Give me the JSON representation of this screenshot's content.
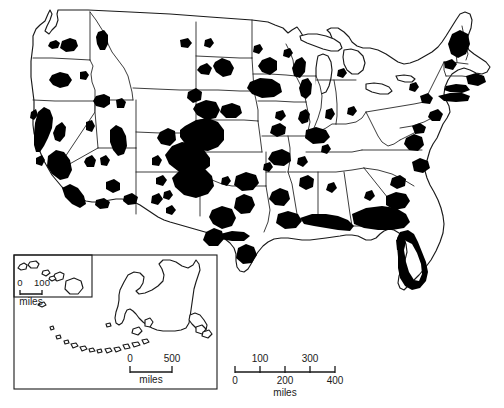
{
  "map": {
    "title": "United States distribution map",
    "description": "Black-and-white thematic map of the contiguous United States with state boundaries and solid black shaded distribution areas, plus Alaska and Hawaii insets.",
    "background_color": "#ffffff",
    "outline_color": "#1a1a1a",
    "fill_color": "#000000",
    "region_label_conus": "Contiguous United States",
    "region_label_alaska": "Alaska",
    "region_label_hawaii": "Hawaii"
  },
  "scales": {
    "main": {
      "name": "main-scale-bar",
      "unit_label": "miles",
      "ticks_above": [
        "100",
        "300"
      ],
      "ticks_below": [
        "0",
        "200",
        "400"
      ],
      "values": [
        0,
        100,
        200,
        300,
        400
      ],
      "max_value": 400
    },
    "alaska": {
      "name": "alaska-scale-bar",
      "unit_label": "miles",
      "ticks": [
        "0",
        "500"
      ],
      "values": [
        0,
        500
      ],
      "max_value": 500
    },
    "hawaii": {
      "name": "hawaii-scale-bar",
      "unit_label": "miles",
      "ticks": [
        "0",
        "100"
      ],
      "values": [
        0,
        100
      ],
      "max_value": 100
    }
  }
}
